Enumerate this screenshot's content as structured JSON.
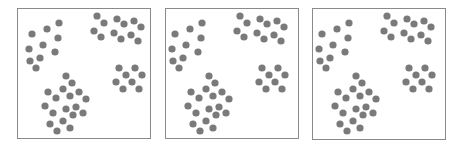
{
  "figure": {
    "width": 460,
    "height": 146,
    "background": "#ffffff",
    "frame_color": "#8a8a8a",
    "dot_color": "#7a7a7a",
    "dot_radius": 3.6
  },
  "base_dots": {
    "cluster_upper_left": [
      [
        42,
        15
      ],
      [
        30,
        21
      ],
      [
        15,
        26
      ],
      [
        41,
        30
      ],
      [
        26,
        37
      ],
      [
        12,
        41
      ],
      [
        38,
        44
      ],
      [
        13,
        53
      ],
      [
        23,
        50
      ],
      [
        19,
        60
      ]
    ],
    "cluster_upper_right": [
      [
        80,
        8
      ],
      [
        87,
        15
      ],
      [
        100,
        11
      ],
      [
        107,
        16
      ],
      [
        117,
        13
      ],
      [
        124,
        19
      ],
      [
        77,
        23
      ],
      [
        84,
        29
      ],
      [
        97,
        25
      ],
      [
        104,
        31
      ],
      [
        114,
        27
      ],
      [
        121,
        33
      ]
    ],
    "cluster_right_middle": [
      [
        102,
        60
      ],
      [
        109,
        67
      ],
      [
        118,
        60
      ],
      [
        125,
        67
      ],
      [
        99,
        74
      ],
      [
        106,
        81
      ],
      [
        115,
        74
      ],
      [
        122,
        81
      ]
    ],
    "cluster_bottom": [
      [
        49,
        68
      ],
      [
        55,
        75
      ],
      [
        31,
        84
      ],
      [
        39,
        90
      ],
      [
        46,
        81
      ],
      [
        53,
        88
      ],
      [
        62,
        84
      ],
      [
        69,
        91
      ],
      [
        28,
        98
      ],
      [
        36,
        105
      ],
      [
        49,
        101
      ],
      [
        56,
        107
      ],
      [
        59,
        99
      ],
      [
        66,
        105
      ],
      [
        33,
        116
      ],
      [
        40,
        123
      ],
      [
        46,
        113
      ],
      [
        53,
        120
      ]
    ]
  },
  "panels": [
    {
      "id": "panel-1",
      "x": 17,
      "y": 8,
      "width": 133,
      "height": 130,
      "dx": 0,
      "dy": 0
    },
    {
      "id": "panel-2",
      "x": 165,
      "y": 8,
      "width": 133,
      "height": 130,
      "dx": -5,
      "dy": 0
    },
    {
      "id": "panel-3",
      "x": 312,
      "y": 8,
      "width": 133,
      "height": 131,
      "dx": -5,
      "dy": 0
    }
  ]
}
